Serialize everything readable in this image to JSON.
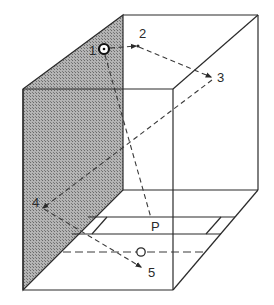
{
  "diagram": {
    "colors": {
      "line": "#2b2b2b",
      "shade": "#8a8a8a",
      "background": "#ffffff"
    },
    "points": [
      {
        "id": "1",
        "label": "1",
        "kind": "source-circle"
      },
      {
        "id": "2",
        "label": "2",
        "kind": "reflection-point"
      },
      {
        "id": "3",
        "label": "3",
        "kind": "reflection-point"
      },
      {
        "id": "4",
        "label": "4",
        "kind": "reflection-point"
      },
      {
        "id": "5",
        "label": "5",
        "kind": "end-point"
      },
      {
        "id": "P",
        "label": "P",
        "kind": "point"
      },
      {
        "id": "O",
        "label": "",
        "kind": "observer-circle"
      }
    ],
    "paths": [
      {
        "from": "1",
        "to": "2",
        "style": "dashed-arrow"
      },
      {
        "from": "2",
        "to": "3",
        "style": "dashed-arrow"
      },
      {
        "from": "3",
        "to": "4",
        "style": "dashed-arrow"
      },
      {
        "from": "4",
        "to": "5",
        "style": "dashed-arrow"
      },
      {
        "from": "1",
        "to": "P",
        "style": "dashed"
      }
    ],
    "labels": {
      "p1": "1",
      "p2": "2",
      "p3": "3",
      "p4": "4",
      "p5": "5",
      "pP": "P"
    }
  }
}
